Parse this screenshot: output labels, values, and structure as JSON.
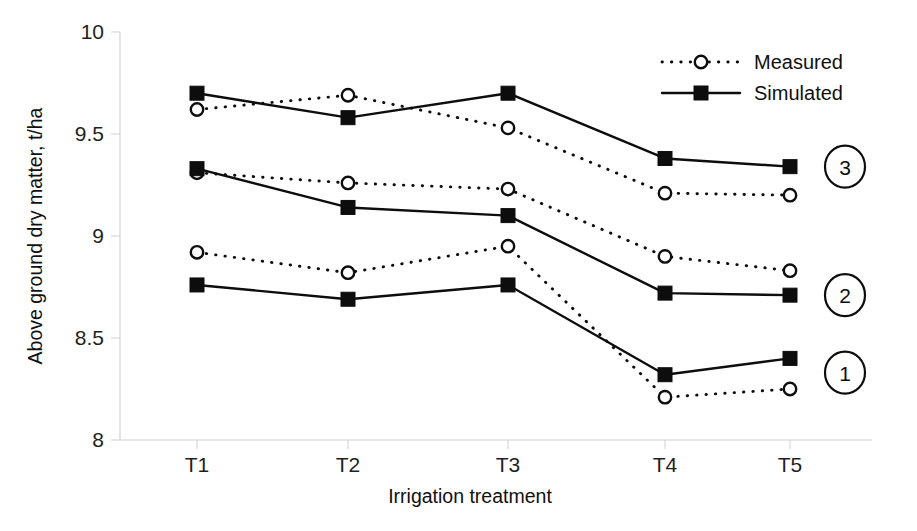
{
  "chart_data": {
    "type": "line",
    "title": "",
    "xlabel": "Irrigation treatment",
    "ylabel": "Above ground dry matter, t/ha",
    "categories": [
      "T1",
      "T2",
      "T3",
      "T4",
      "T5"
    ],
    "ylim": [
      8,
      10
    ],
    "yticks": [
      8,
      8.5,
      9,
      9.5,
      10
    ],
    "ytick_labels": [
      "8",
      "8.5",
      "9",
      "9.5",
      "10"
    ],
    "grid": false,
    "legend_position": "top-right",
    "legend": [
      {
        "label": "Measured",
        "marker": "open-circle",
        "line": "dotted"
      },
      {
        "label": "Simulated",
        "marker": "filled-square",
        "line": "solid"
      }
    ],
    "groups": [
      {
        "badge": "3",
        "series": [
          {
            "name": "Measured",
            "style": "dotted",
            "marker": "open-circle",
            "values": [
              9.62,
              9.69,
              9.53,
              9.21,
              9.2
            ]
          },
          {
            "name": "Simulated",
            "style": "solid",
            "marker": "filled-square",
            "values": [
              9.7,
              9.58,
              9.7,
              9.38,
              9.34
            ]
          }
        ]
      },
      {
        "badge": "2",
        "series": [
          {
            "name": "Measured",
            "style": "dotted",
            "marker": "open-circle",
            "values": [
              9.31,
              9.26,
              9.23,
              8.9,
              8.83
            ]
          },
          {
            "name": "Simulated",
            "style": "solid",
            "marker": "filled-square",
            "values": [
              9.33,
              9.14,
              9.1,
              8.72,
              8.71
            ]
          }
        ]
      },
      {
        "badge": "1",
        "series": [
          {
            "name": "Measured",
            "style": "dotted",
            "marker": "open-circle",
            "values": [
              8.92,
              8.82,
              8.95,
              8.21,
              8.25
            ]
          },
          {
            "name": "Simulated",
            "style": "solid",
            "marker": "filled-square",
            "values": [
              8.76,
              8.69,
              8.76,
              8.32,
              8.4
            ]
          }
        ]
      }
    ],
    "group_badge_values": [
      "3",
      "2",
      "1"
    ],
    "group_badge_y": [
      9.34,
      8.71,
      8.33
    ],
    "colors": {
      "ink": "#0d0d0d",
      "axis": "#d0d0d0",
      "background": "#ffffff"
    }
  }
}
